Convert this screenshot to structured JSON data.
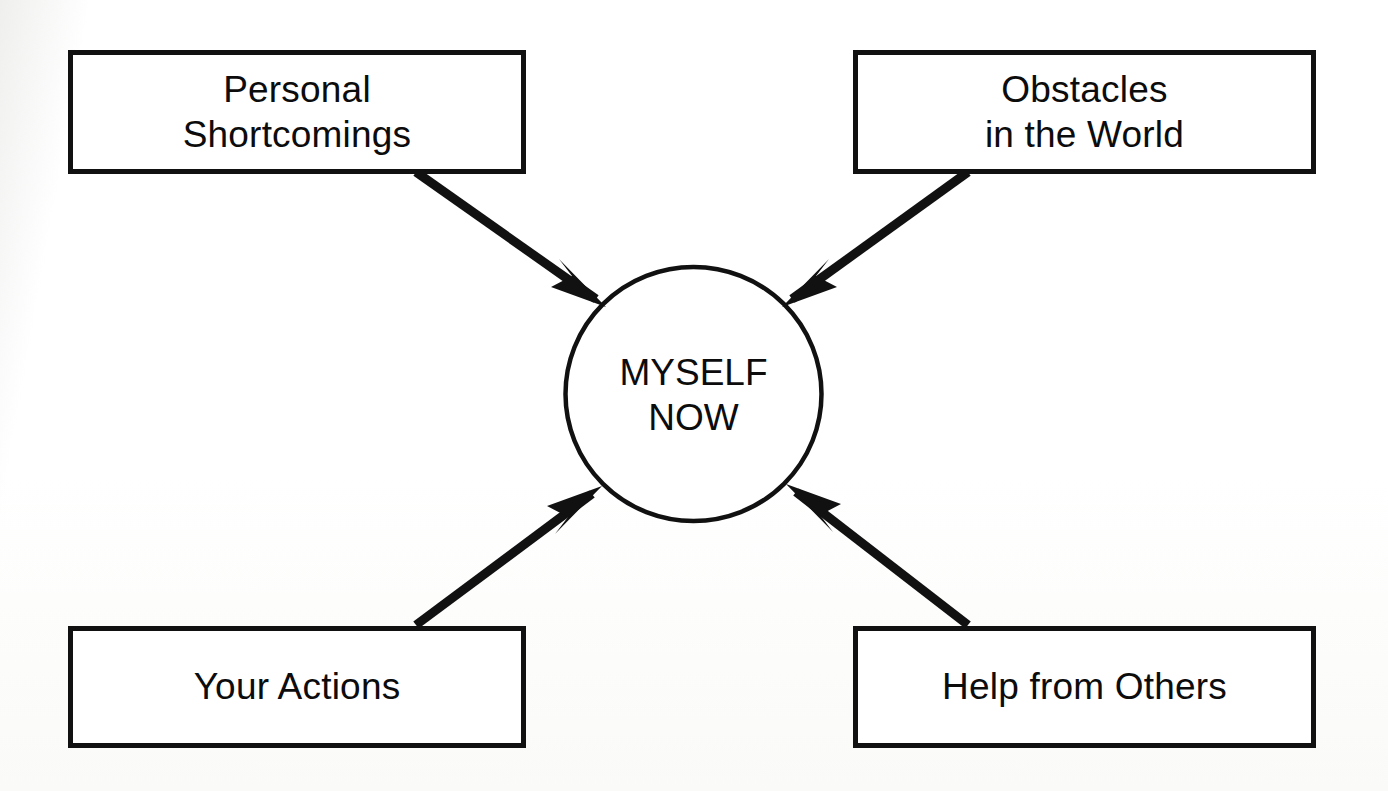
{
  "diagram": {
    "background_color": "#fdfdfc",
    "stroke_color": "#111111",
    "text_color": "#0c0c0c",
    "center": {
      "id": "myself-now",
      "shape": "ellipse",
      "label": "MYSELF\nNOW",
      "line1": "MYSELF",
      "line2": "NOW"
    },
    "nodes": [
      {
        "id": "personal-shortcomings",
        "shape": "rectangle",
        "position": "top-left",
        "label": "Personal\nShortcomings",
        "line1": "Personal",
        "line2": "Shortcomings"
      },
      {
        "id": "obstacles-in-the-world",
        "shape": "rectangle",
        "position": "top-right",
        "label": "Obstacles\nin the World",
        "line1": "Obstacles",
        "line2": "in the World"
      },
      {
        "id": "your-actions",
        "shape": "rectangle",
        "position": "bottom-left",
        "label": "Your Actions",
        "line1": "Your Actions",
        "line2": ""
      },
      {
        "id": "help-from-others",
        "shape": "rectangle",
        "position": "bottom-right",
        "label": "Help from Others",
        "line1": "Help from Others",
        "line2": ""
      }
    ],
    "edges": [
      {
        "id": "edge-personal-shortcomings-to-myself-now",
        "from": "personal-shortcomings",
        "to": "myself-now",
        "direction": "to-center",
        "arrowhead": "at-center"
      },
      {
        "id": "edge-obstacles-to-myself-now",
        "from": "obstacles-in-the-world",
        "to": "myself-now",
        "direction": "to-center",
        "arrowhead": "at-center"
      },
      {
        "id": "edge-your-actions-to-myself-now",
        "from": "your-actions",
        "to": "myself-now",
        "direction": "to-center",
        "arrowhead": "at-center"
      },
      {
        "id": "edge-help-from-others-to-myself-now",
        "from": "help-from-others",
        "to": "myself-now",
        "direction": "to-center",
        "arrowhead": "at-center"
      }
    ]
  }
}
